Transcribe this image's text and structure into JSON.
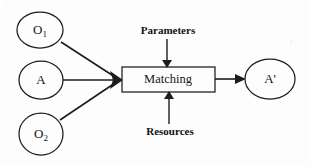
{
  "figure": {
    "background_color": "#fdfdfd",
    "line_color": "#1c1c1c",
    "text_color": "#141414"
  },
  "nodes": {
    "input_1": {
      "label": "O",
      "subscript": "1",
      "shape": "ellipse"
    },
    "input_2": {
      "label": "A",
      "subscript": "",
      "shape": "ellipse"
    },
    "input_3": {
      "label": "O",
      "subscript": "2",
      "shape": "ellipse"
    },
    "process": {
      "label": "Matching",
      "shape": "rectangle"
    },
    "output": {
      "label": "A'",
      "subscript": "",
      "shape": "ellipse"
    }
  },
  "annotations": {
    "top": "Parameters",
    "bottom": "Resources"
  },
  "icons": {
    "arrow_into_process": "arrowhead-right-icon",
    "arrow_to_output": "arrowhead-right-icon",
    "arrow_parameters": "arrowhead-down-icon",
    "arrow_resources": "arrowhead-up-icon"
  }
}
